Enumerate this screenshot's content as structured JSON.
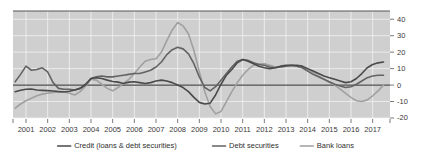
{
  "chart_data": {
    "type": "line",
    "title": "",
    "subtitle": "",
    "xlabel": "",
    "ylabel": "",
    "ylim": [
      -20,
      45
    ],
    "xlim": [
      2000.4,
      2017.8
    ],
    "grid": true,
    "legend_position": "bottom",
    "y_ticks": [
      40,
      30,
      20,
      10,
      0,
      -10,
      -20
    ],
    "y_tick_labels": [
      "40",
      "30",
      "20",
      "10",
      "0",
      "-10",
      "-20"
    ],
    "x_ticks": [
      2001,
      2002,
      2003,
      2004,
      2005,
      2006,
      2007,
      2008,
      2009,
      2010,
      2011,
      2012,
      2013,
      2014,
      2015,
      2016,
      2017
    ],
    "x_tick_labels": [
      "2001",
      "2002",
      "2003",
      "2004",
      "2005",
      "2006",
      "2007",
      "2008",
      "2009",
      "2010",
      "2011",
      "2012",
      "2013",
      "2014",
      "2015",
      "2016",
      "2017"
    ],
    "zero_line": 0,
    "colors": {
      "credit": "#4a4a4a",
      "debt_securities": "#636363",
      "bank_loans": "#a0a0a0",
      "plot_background": "#cfcfcf",
      "gridline": "#f2f2f2",
      "axis": "#555555"
    },
    "x": [
      2000.5,
      2000.75,
      2001.0,
      2001.25,
      2001.5,
      2001.75,
      2002.0,
      2002.25,
      2002.5,
      2002.75,
      2003.0,
      2003.25,
      2003.5,
      2003.75,
      2004.0,
      2004.25,
      2004.5,
      2004.75,
      2005.0,
      2005.25,
      2005.5,
      2005.75,
      2006.0,
      2006.25,
      2006.5,
      2006.75,
      2007.0,
      2007.25,
      2007.5,
      2007.75,
      2008.0,
      2008.25,
      2008.5,
      2008.75,
      2009.0,
      2009.25,
      2009.5,
      2009.75,
      2010.0,
      2010.25,
      2010.5,
      2010.75,
      2011.0,
      2011.25,
      2011.5,
      2011.75,
      2012.0,
      2012.25,
      2012.5,
      2012.75,
      2013.0,
      2013.25,
      2013.5,
      2013.75,
      2014.0,
      2014.25,
      2014.5,
      2014.75,
      2015.0,
      2015.25,
      2015.5,
      2015.75,
      2016.0,
      2016.25,
      2016.5,
      2016.75,
      2017.0,
      2017.25,
      2017.5
    ],
    "series": [
      {
        "name": "Credit (loans & debt securities)",
        "color": "#4a4a4a",
        "width": 1.6,
        "values": [
          -4.0,
          -3.2,
          -2.5,
          -2.4,
          -3.0,
          -3.2,
          -3.4,
          -3.6,
          -4.0,
          -4.2,
          -3.8,
          -3.0,
          -2.0,
          0.5,
          4.0,
          4.5,
          4.0,
          3.0,
          2.2,
          1.8,
          1.0,
          1.8,
          2.0,
          1.5,
          1.0,
          1.5,
          2.5,
          3.0,
          2.5,
          1.5,
          0.0,
          -1.5,
          -4.0,
          -7.5,
          -10.5,
          -11.5,
          -11.0,
          -6.0,
          0.5,
          6.0,
          9.5,
          13.5,
          15.5,
          14.5,
          13.0,
          11.5,
          10.5,
          10.0,
          10.5,
          11.5,
          12.0,
          12.0,
          12.0,
          11.5,
          10.0,
          8.5,
          7.0,
          5.5,
          4.5,
          3.5,
          2.5,
          1.5,
          2.0,
          4.0,
          7.0,
          10.5,
          12.5,
          13.5,
          14.0
        ]
      },
      {
        "name": "Debt securities",
        "color": "#636363",
        "width": 1.6,
        "values": [
          2.0,
          6.5,
          11.5,
          9.0,
          9.5,
          10.5,
          8.0,
          1.5,
          -2.0,
          -2.5,
          -2.5,
          -3.0,
          -2.0,
          0.0,
          4.0,
          5.0,
          5.5,
          5.0,
          5.0,
          5.5,
          6.0,
          6.5,
          7.0,
          7.0,
          8.0,
          9.0,
          11.0,
          14.0,
          18.5,
          21.5,
          23.0,
          22.0,
          19.0,
          13.0,
          5.0,
          -1.5,
          -3.5,
          -1.0,
          3.0,
          7.0,
          11.0,
          14.5,
          15.5,
          15.0,
          13.5,
          12.5,
          12.0,
          11.0,
          10.5,
          11.0,
          11.5,
          12.0,
          11.5,
          10.5,
          8.5,
          6.5,
          5.0,
          3.5,
          2.0,
          0.5,
          -0.5,
          -1.5,
          -1.0,
          0.5,
          2.5,
          4.5,
          5.5,
          6.0,
          6.0
        ]
      },
      {
        "name": "Bank loans",
        "color": "#a0a0a0",
        "width": 1.6,
        "values": [
          -14.0,
          -11.5,
          -9.5,
          -8.0,
          -6.5,
          -5.5,
          -5.0,
          -4.5,
          -4.0,
          -4.0,
          -5.0,
          -6.0,
          -4.0,
          -0.5,
          3.5,
          3.0,
          0.5,
          -2.0,
          -3.5,
          -1.5,
          1.0,
          3.5,
          7.0,
          11.0,
          14.5,
          15.5,
          16.0,
          20.0,
          27.0,
          33.5,
          38.0,
          36.0,
          31.0,
          21.0,
          8.0,
          -4.0,
          -13.0,
          -17.5,
          -16.0,
          -10.0,
          -4.0,
          1.5,
          6.0,
          9.5,
          12.0,
          13.0,
          13.0,
          12.0,
          11.0,
          11.0,
          11.5,
          11.5,
          11.5,
          11.0,
          9.5,
          7.5,
          5.5,
          3.5,
          1.5,
          0.0,
          -2.5,
          -5.0,
          -7.5,
          -9.5,
          -10.0,
          -9.0,
          -6.5,
          -3.5,
          0.0
        ]
      }
    ],
    "legend": [
      {
        "label": "Credit (loans & debt securities)",
        "color": "#4a4a4a"
      },
      {
        "label": "Debt securities",
        "color": "#636363"
      },
      {
        "label": "Bank loans",
        "color": "#a0a0a0"
      }
    ]
  }
}
